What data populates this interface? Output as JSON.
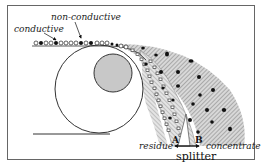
{
  "diagram": {
    "labels": {
      "conductive": "conductive",
      "non_conductive": "non-conductive",
      "residue": "residue",
      "concentrate": "concentrate",
      "splitter": "splitter",
      "point_a": "A",
      "point_b": "B"
    },
    "colors": {
      "frame": "#555555",
      "drum_outline": "#333333",
      "electrode_fill": "#c8c8c8",
      "hatch": "#8a8a8a",
      "particle_conductive": "#111111",
      "particle_nonconductive": "#ffffff"
    },
    "legend": [
      {
        "name": "conductive",
        "marker": "filled-dot"
      },
      {
        "name": "non-conductive",
        "marker": "hollow-dot"
      }
    ]
  }
}
